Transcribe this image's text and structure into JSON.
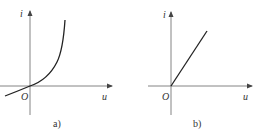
{
  "figure": {
    "panels": [
      {
        "id": "a",
        "caption": "a)",
        "y_axis_label": "i",
        "x_axis_label": "u",
        "origin_label": "O",
        "curve": "nonlinear exponential-like i-u characteristic passing through origin, slightly negative for u<0"
      },
      {
        "id": "b",
        "caption": "b)",
        "y_axis_label": "i",
        "x_axis_label": "u",
        "origin_label": "O",
        "curve": "straight line starting at origin, zero for u<0 (ideal rectified linear characteristic)"
      }
    ]
  },
  "colors": {
    "axis": "#555555",
    "curve": "#222222",
    "text": "#333333"
  }
}
